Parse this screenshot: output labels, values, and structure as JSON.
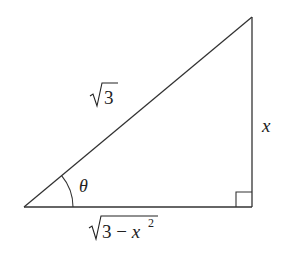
{
  "diagram": {
    "type": "right-triangle",
    "vertices": {
      "bottom_left": [
        24,
        207
      ],
      "bottom_right": [
        252,
        207
      ],
      "top_right": [
        252,
        17
      ]
    },
    "labels": {
      "hypotenuse": "√3",
      "hypotenuse_radicand": "3",
      "opposite": "x",
      "adjacent_radicand": "3 − x",
      "adjacent_exponent": "2",
      "angle": "θ"
    },
    "right_angle_marker": true,
    "angle_arc": true,
    "stroke_color": "#333333"
  }
}
